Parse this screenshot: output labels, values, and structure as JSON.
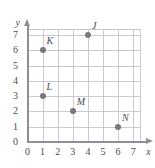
{
  "chart_data": {
    "type": "scatter",
    "title": "",
    "subtitle": "",
    "xlabel": "x",
    "ylabel": "y",
    "xlim": [
      0,
      7
    ],
    "ylim": [
      0,
      7
    ],
    "xticks": [
      "0",
      "1",
      "2",
      "3",
      "4",
      "5",
      "6",
      "7"
    ],
    "yticks": [
      "0",
      "1",
      "2",
      "3",
      "4",
      "5",
      "6",
      "7"
    ],
    "grid": true,
    "legend": "none",
    "colors": {
      "point": "#78787f",
      "grid": "#c9c9cf",
      "axis": "#8e8e96",
      "text": "#4a4a4f",
      "background": "#ffffff"
    },
    "points": [
      {
        "label": "J",
        "x": 4,
        "y": 7
      },
      {
        "label": "K",
        "x": 1,
        "y": 6
      },
      {
        "label": "L",
        "x": 1,
        "y": 3
      },
      {
        "label": "M",
        "x": 3,
        "y": 2
      },
      {
        "label": "N",
        "x": 6,
        "y": 1
      }
    ]
  }
}
